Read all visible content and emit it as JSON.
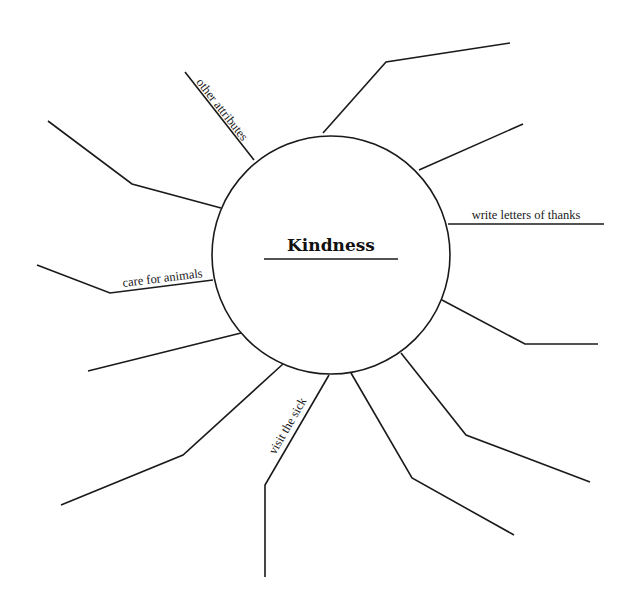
{
  "diagram": {
    "type": "web-organizer",
    "center": {
      "title": "Kindness",
      "cx": 331,
      "cy": 255,
      "r": 119,
      "title_x": 331,
      "title_y": 251,
      "underline": [
        264,
        259,
        398,
        259
      ]
    },
    "colors": {
      "stroke": "#1a1a1a",
      "background": "#ffffff",
      "text": "#111111"
    },
    "spokes": [
      {
        "id": "other-attributes",
        "label": "other attributes",
        "points": "254,160 185,72",
        "label_x": 219,
        "label_y": 112,
        "label_angle": 52
      },
      {
        "id": "ne-upper",
        "label": "",
        "points": "323,133 386,62 510,43"
      },
      {
        "id": "ne-lower",
        "label": "",
        "points": "419,170 523,124"
      },
      {
        "id": "write-letters-of-thanks",
        "label": "write letters of thanks",
        "points": "448,224 604,224",
        "label_x": 526,
        "label_y": 219,
        "label_angle": 0
      },
      {
        "id": "e-lower",
        "label": "",
        "points": "442,300 525,344 598,344"
      },
      {
        "id": "se-upper",
        "label": "",
        "points": "401,353 466,435 590,482"
      },
      {
        "id": "se-lower",
        "label": "",
        "points": "351,373 412,478 514,535"
      },
      {
        "id": "visit-the-sick",
        "label": "visit the sick",
        "points": "329,375 265,485 265,577",
        "label_x": 291,
        "label_y": 428,
        "label_angle": -60
      },
      {
        "id": "sw-upper",
        "label": "",
        "points": "283,364 183,455 61,505"
      },
      {
        "id": "w-lower",
        "label": "",
        "points": "241,333 88,371"
      },
      {
        "id": "care-for-animals",
        "label": "care for animals",
        "points": "213,280 110,293 37,265",
        "label_x": 163,
        "label_y": 282,
        "label_angle": -7
      },
      {
        "id": "nw",
        "label": "",
        "points": "221,208 132,184 48,121"
      }
    ]
  }
}
